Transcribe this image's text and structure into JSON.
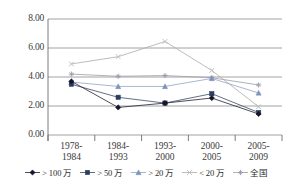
{
  "chart_data": {
    "type": "line",
    "title": "",
    "subtitle": "",
    "xlabel": "",
    "ylabel": "",
    "ylim": [
      0,
      8
    ],
    "yticks": [
      "0.00",
      "2.00",
      "4.00",
      "6.00",
      "8.00"
    ],
    "ytick_values": [
      0,
      2,
      4,
      6,
      8
    ],
    "grid": true,
    "legend_position": "bottom",
    "categories": [
      "1978-\n1984",
      "1984-\n1993",
      "1993-\n2000",
      "2000-\n2005",
      "2005-\n2009"
    ],
    "category_lines": [
      [
        "1978-",
        "1984"
      ],
      [
        "1984-",
        "1993"
      ],
      [
        "1993-",
        "2000"
      ],
      [
        "2000-",
        "2005"
      ],
      [
        "2005-",
        "2009"
      ]
    ],
    "series": [
      {
        "name": "> 100 万",
        "marker": "diamond",
        "color": "#14142b",
        "line_color": "#2e2e3d",
        "values": [
          3.7,
          1.9,
          2.2,
          2.55,
          1.45
        ]
      },
      {
        "name": "> 50 万",
        "marker": "square",
        "color": "#2c3c63",
        "line_color": "#4a546e",
        "values": [
          3.5,
          2.6,
          2.2,
          2.85,
          1.55
        ]
      },
      {
        "name": "> 20 万",
        "marker": "triangle",
        "color": "#7f93bc",
        "line_color": "#9aa9c9",
        "values": [
          3.65,
          3.35,
          3.35,
          3.9,
          2.9
        ]
      },
      {
        "name": "< 20 万",
        "marker": "cross",
        "color": "#b9b9b9",
        "line_color": "#b0b0b0",
        "values": [
          4.9,
          5.4,
          6.45,
          4.45,
          1.95
        ]
      },
      {
        "name": "全国",
        "marker": "star",
        "color": "#9a9aa8",
        "line_color": "#a2a2ad",
        "values": [
          4.2,
          4.05,
          4.1,
          3.95,
          3.45
        ]
      }
    ]
  },
  "colors": {
    "axis": "#6d6d6d",
    "grid": "#8c8c8c",
    "text": "#3a3a3a",
    "background": "#ffffff"
  }
}
